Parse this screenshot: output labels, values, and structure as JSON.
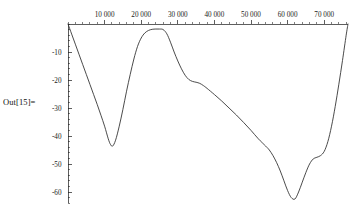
{
  "output_label": "Out[15]=",
  "chart_data": {
    "type": "line",
    "title": "",
    "subtitle": "",
    "xlabel": "",
    "ylabel": "",
    "xlim": [
      0,
      76500
    ],
    "ylim": [
      -64,
      1
    ],
    "grid": false,
    "legend": null,
    "axes": {
      "x_axis_position": 0,
      "y_axis_position": 0,
      "x_tick_labels": [
        "10 000",
        "20 000",
        "30 000",
        "40 000",
        "50 000",
        "60 000",
        "70 000"
      ],
      "x_tick_values": [
        10000,
        20000,
        30000,
        40000,
        50000,
        60000,
        70000
      ],
      "x_minor_step": 2000,
      "y_tick_labels": [
        "-10",
        "-20",
        "-30",
        "-40",
        "-50",
        "-60"
      ],
      "y_tick_values": [
        -10,
        -20,
        -30,
        -40,
        -50,
        -60
      ],
      "y_minor_step": 2,
      "x_ticks_on_top": true,
      "y_ticks_on_left": true
    },
    "series": [
      {
        "name": "curve",
        "color": "#2b2b2b",
        "x": [
          0,
          1000,
          2000,
          3000,
          4000,
          5000,
          6000,
          7000,
          8000,
          9000,
          10000,
          11000,
          11600,
          12200,
          13000,
          14000,
          15000,
          16000,
          17000,
          18000,
          19000,
          20000,
          21000,
          22000,
          23000,
          24000,
          25000,
          26000,
          27000,
          28000,
          29000,
          30000,
          31000,
          32000,
          33000,
          34000,
          35000,
          36000,
          37000,
          38000,
          40000,
          42000,
          44000,
          46000,
          48000,
          50000,
          52000,
          54000,
          55000,
          56000,
          57000,
          58000,
          59000,
          60000,
          61000,
          62000,
          63000,
          64000,
          65000,
          66000,
          67000,
          68000,
          69000,
          70000,
          71000,
          72000,
          73000,
          74000,
          75000,
          76000,
          76500
        ],
        "y": [
          0,
          -3.6,
          -7.2,
          -10.8,
          -14.4,
          -18.0,
          -21.6,
          -25.2,
          -28.8,
          -32.6,
          -36.5,
          -41.0,
          -43.0,
          -43.6,
          -41.5,
          -36.5,
          -30.5,
          -24.0,
          -18.0,
          -12.5,
          -8.0,
          -5.0,
          -3.2,
          -2.3,
          -1.9,
          -1.8,
          -1.8,
          -2.0,
          -3.5,
          -6.5,
          -10.0,
          -13.2,
          -16.0,
          -18.3,
          -19.8,
          -20.5,
          -20.8,
          -21.2,
          -22.0,
          -23.0,
          -25.2,
          -27.5,
          -30.0,
          -32.5,
          -35.2,
          -38.0,
          -41.0,
          -43.6,
          -45.0,
          -47.0,
          -49.5,
          -52.5,
          -56.0,
          -59.5,
          -62.0,
          -62.5,
          -60.0,
          -56.5,
          -53.0,
          -50.0,
          -48.2,
          -47.6,
          -47.0,
          -45.5,
          -42.0,
          -36.5,
          -29.5,
          -21.5,
          -13.0,
          -4.0,
          0
        ]
      }
    ],
    "annotations": []
  },
  "colors": {
    "background": "#ffffff",
    "axis": "#1a1a1a",
    "curve": "#2b2b2b",
    "text": "#111111"
  }
}
